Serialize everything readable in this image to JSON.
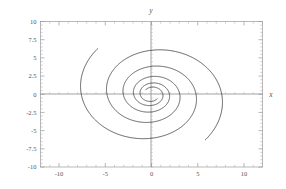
{
  "figure": {
    "background_color": "#ffffff",
    "curve_color": "#2b2b2b",
    "frame_color": "#9a9a9a",
    "axis_color": "#8a8a8a",
    "label_color": "#555555"
  },
  "chart_data": {
    "type": "line",
    "title": "",
    "subtitle": "",
    "xlabel": "x",
    "ylabel": "y",
    "xlim": [
      -12,
      12
    ],
    "ylim": [
      -10,
      10
    ],
    "grid": false,
    "legend": "none",
    "xticks": [
      -10,
      -5,
      0,
      5,
      10
    ],
    "xtick_labels": [
      "-10",
      "-5",
      "0",
      "5",
      "10"
    ],
    "yticks": [
      -10,
      -7.5,
      -5,
      -2.5,
      0,
      2.5,
      5,
      7.5,
      10
    ],
    "ytick_labels": [
      "-10",
      "-7.5",
      "-5",
      "-2.5",
      "0",
      "2.5",
      "5",
      "7.5",
      "10"
    ],
    "x_minor_tick_step": 1,
    "y_minor_tick_step": 0.5,
    "series": [
      {
        "name": "trajectory-1",
        "type": "log-spiral",
        "r0": 8.55,
        "decay_b": 0.145,
        "theta_start_deg": 133,
        "theta_end_deg": 1035,
        "direction": "counterclockwise-inward",
        "start_point": [
          -5.83,
          6.25
        ],
        "end_point": [
          0,
          0
        ]
      },
      {
        "name": "trajectory-2",
        "type": "log-spiral",
        "r0": 8.55,
        "decay_b": 0.145,
        "theta_start_deg": -47,
        "theta_end_deg": 855,
        "direction": "counterclockwise-inward",
        "start_point": [
          5.83,
          -6.25
        ],
        "end_point": [
          0,
          0
        ]
      }
    ]
  }
}
